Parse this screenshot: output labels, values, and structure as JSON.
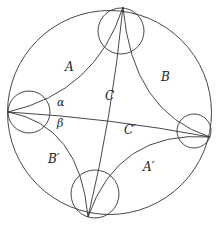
{
  "diagram": {
    "type": "hyperbolic-disk",
    "outer_circle": {
      "cx": 109.5,
      "cy": 112.5,
      "r": 102
    },
    "ideal_vertices": [
      {
        "name": "top",
        "x": 123,
        "y": 7
      },
      {
        "name": "left",
        "x": 8,
        "y": 112
      },
      {
        "name": "right",
        "x": 210,
        "y": 137
      },
      {
        "name": "bottom",
        "x": 88,
        "y": 217
      }
    ],
    "horocycles": [
      {
        "name": "top",
        "cx": 121,
        "cy": 31,
        "r": 23
      },
      {
        "name": "left",
        "cx": 29,
        "cy": 112,
        "r": 21
      },
      {
        "name": "right",
        "cx": 194,
        "cy": 131,
        "r": 17
      },
      {
        "name": "bottom",
        "cx": 95,
        "cy": 194,
        "r": 24
      }
    ],
    "labels": {
      "A": "A",
      "B": "B",
      "C": "C",
      "C_prime": "C′",
      "B_prime": "B′",
      "A_prime": "A′",
      "alpha": "α",
      "beta": "β"
    }
  }
}
